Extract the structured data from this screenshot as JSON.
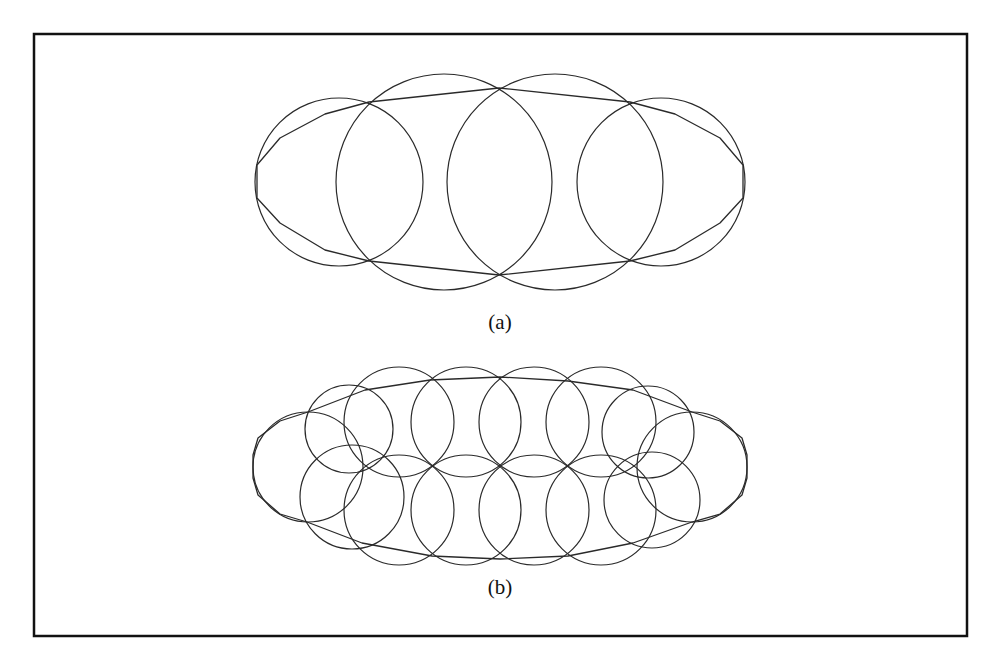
{
  "figure": {
    "frame": {
      "x": 34,
      "y": 34,
      "width": 933,
      "height": 602,
      "color": "#111111"
    },
    "panels": [
      {
        "id": "a",
        "label": "(a)",
        "label_pos": {
          "x": 500,
          "y": 329
        },
        "circles": [
          {
            "cx": 339,
            "cy": 182,
            "r": 84
          },
          {
            "cx": 444,
            "cy": 182,
            "r": 108
          },
          {
            "cx": 555,
            "cy": 182,
            "r": 108
          },
          {
            "cx": 661,
            "cy": 182,
            "r": 84
          }
        ],
        "polygon": [
          [
            257,
            165
          ],
          [
            280,
            138
          ],
          [
            325,
            114
          ],
          [
            369,
            102
          ],
          [
            499,
            88
          ],
          [
            630,
            102
          ],
          [
            675,
            114
          ],
          [
            720,
            138
          ],
          [
            743,
            165
          ],
          [
            743,
            198
          ],
          [
            720,
            223
          ],
          [
            675,
            250
          ],
          [
            630,
            261
          ],
          [
            499,
            275
          ],
          [
            369,
            261
          ],
          [
            325,
            250
          ],
          [
            280,
            223
          ],
          [
            257,
            198
          ]
        ]
      },
      {
        "id": "b",
        "label": "(b)",
        "label_pos": {
          "x": 500,
          "y": 594
        },
        "circles": [
          {
            "cx": 308,
            "cy": 467,
            "r": 55
          },
          {
            "cx": 349,
            "cy": 429,
            "r": 44
          },
          {
            "cx": 352,
            "cy": 497,
            "r": 52
          },
          {
            "cx": 399,
            "cy": 422,
            "r": 55
          },
          {
            "cx": 466,
            "cy": 422,
            "r": 55
          },
          {
            "cx": 534,
            "cy": 422,
            "r": 55
          },
          {
            "cx": 601,
            "cy": 422,
            "r": 55
          },
          {
            "cx": 399,
            "cy": 510,
            "r": 55
          },
          {
            "cx": 466,
            "cy": 510,
            "r": 55
          },
          {
            "cx": 534,
            "cy": 510,
            "r": 55
          },
          {
            "cx": 601,
            "cy": 510,
            "r": 55
          },
          {
            "cx": 648,
            "cy": 432,
            "r": 46
          },
          {
            "cx": 652,
            "cy": 500,
            "r": 48
          },
          {
            "cx": 692,
            "cy": 467,
            "r": 55
          }
        ],
        "polygon": [
          [
            253,
            455
          ],
          [
            258,
            438
          ],
          [
            280,
            421
          ],
          [
            308,
            412
          ],
          [
            365,
            390
          ],
          [
            430,
            380
          ],
          [
            500,
            377
          ],
          [
            568,
            381
          ],
          [
            633,
            390
          ],
          [
            692,
            412
          ],
          [
            720,
            421
          ],
          [
            742,
            438
          ],
          [
            747,
            455
          ],
          [
            747,
            478
          ],
          [
            742,
            495
          ],
          [
            720,
            514
          ],
          [
            692,
            522
          ],
          [
            633,
            543
          ],
          [
            568,
            556
          ],
          [
            500,
            559
          ],
          [
            432,
            556
          ],
          [
            362,
            543
          ],
          [
            307,
            522
          ],
          [
            280,
            514
          ],
          [
            258,
            495
          ],
          [
            253,
            478
          ]
        ]
      }
    ]
  }
}
